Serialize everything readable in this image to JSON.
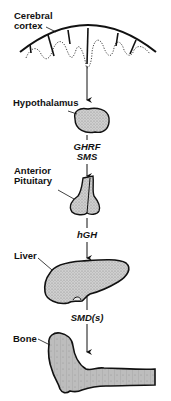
{
  "diagram": {
    "type": "physiological-pathway",
    "nodes": [
      {
        "id": "cortex",
        "label_line1": "Cerebral",
        "label_line2": "cortex"
      },
      {
        "id": "hypothalamus",
        "label": "Hypothalamus"
      },
      {
        "id": "pituitary",
        "label_line1": "Anterior",
        "label_line2": "Pituitary"
      },
      {
        "id": "liver",
        "label": "Liver"
      },
      {
        "id": "bone",
        "label": "Bone"
      }
    ],
    "edges": [
      {
        "from": "cortex",
        "to": "hypothalamus",
        "label": ""
      },
      {
        "from": "hypothalamus",
        "to": "pituitary",
        "label_line1": "GHRF",
        "label_line2": "SMS"
      },
      {
        "from": "pituitary",
        "to": "liver",
        "label": "hGH"
      },
      {
        "from": "liver",
        "to": "bone",
        "label": "SMD(s)"
      }
    ],
    "colors": {
      "stroke": "#111111",
      "fill": "#c8c8c8",
      "background": "#ffffff"
    }
  }
}
